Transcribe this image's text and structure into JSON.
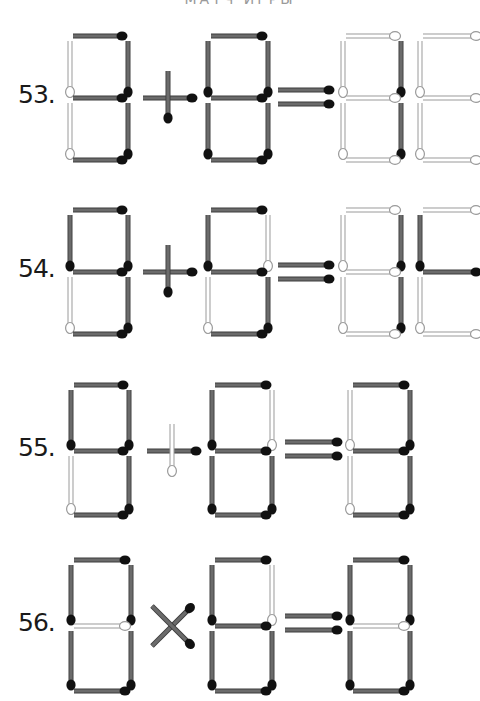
{
  "header": {
    "text": "МАТЧ ИГРЫ"
  },
  "colors": {
    "dark_stick": "#6b6b6b",
    "dark_stick_edge": "#3c3c3c",
    "dark_head": "#111111",
    "light_stick_fill": "#ffffff",
    "light_stick_edge": "#9a9a9a",
    "background": "#ffffff"
  },
  "puzzles": [
    {
      "number": "53.",
      "equation": "8 + 8 = 88",
      "layout": {
        "top": 36,
        "mid": 98,
        "bot": 160
      },
      "digits": [
        {
          "x": 70,
          "w": 58,
          "segments": {
            "a": "dark",
            "b": "dark",
            "c": "dark",
            "d": "dark",
            "e": "light",
            "f": "light",
            "g": "dark"
          }
        },
        {
          "x": 208,
          "w": 60,
          "segments": {
            "a": "dark",
            "b": "dark",
            "c": "dark",
            "d": "dark",
            "e": "dark",
            "f": "dark",
            "g": "dark"
          }
        },
        {
          "x": 343,
          "w": 58,
          "segments": {
            "a": "light",
            "b": "dark",
            "c": "dark",
            "d": "light",
            "e": "light",
            "f": "light",
            "g": "light"
          }
        },
        {
          "x": 420,
          "w": 62,
          "segments": {
            "a": "light",
            "b": "none",
            "c": "none",
            "d": "light",
            "e": "light",
            "f": "light",
            "g": "light"
          }
        }
      ],
      "operator": {
        "type": "plus",
        "cx": 168,
        "h_state": "dark",
        "v_state": "dark"
      },
      "equals": {
        "x1": 278,
        "x2": 332,
        "y1": 90,
        "y2": 104,
        "state": "dark"
      }
    },
    {
      "number": "54.",
      "equation": "8 + 8 = 88",
      "layout": {
        "top": 210,
        "mid": 272,
        "bot": 334
      },
      "digits": [
        {
          "x": 70,
          "w": 58,
          "segments": {
            "a": "dark",
            "b": "dark",
            "c": "dark",
            "d": "dark",
            "e": "light",
            "f": "dark",
            "g": "dark"
          }
        },
        {
          "x": 208,
          "w": 60,
          "segments": {
            "a": "dark",
            "b": "light",
            "c": "dark",
            "d": "dark",
            "e": "light",
            "f": "dark",
            "g": "dark"
          }
        },
        {
          "x": 343,
          "w": 58,
          "segments": {
            "a": "light",
            "b": "dark",
            "c": "dark",
            "d": "light",
            "e": "light",
            "f": "light",
            "g": "light"
          }
        },
        {
          "x": 420,
          "w": 62,
          "segments": {
            "a": "light",
            "b": "none",
            "c": "none",
            "d": "light",
            "e": "light",
            "f": "dark",
            "g": "dark"
          }
        }
      ],
      "operator": {
        "type": "plus",
        "cx": 168,
        "h_state": "dark",
        "v_state": "dark"
      },
      "equals": {
        "x1": 278,
        "x2": 332,
        "y1": 265,
        "y2": 279,
        "state": "dark"
      }
    },
    {
      "number": "55.",
      "equation": "8 + 8 = 8",
      "layout": {
        "top": 385,
        "mid": 451,
        "bot": 515
      },
      "digits": [
        {
          "x": 71,
          "w": 58,
          "segments": {
            "a": "dark",
            "b": "dark",
            "c": "dark",
            "d": "dark",
            "e": "light",
            "f": "dark",
            "g": "dark"
          }
        },
        {
          "x": 212,
          "w": 60,
          "segments": {
            "a": "dark",
            "b": "light",
            "c": "dark",
            "d": "dark",
            "e": "dark",
            "f": "dark",
            "g": "dark"
          }
        },
        {
          "x": 350,
          "w": 60,
          "segments": {
            "a": "dark",
            "b": "dark",
            "c": "dark",
            "d": "dark",
            "e": "light",
            "f": "light",
            "g": "dark"
          }
        }
      ],
      "operator": {
        "type": "plus",
        "cx": 172,
        "h_state": "dark",
        "v_state": "light"
      },
      "equals": {
        "x1": 285,
        "x2": 340,
        "y1": 442,
        "y2": 456,
        "state": "dark"
      }
    },
    {
      "number": "56.",
      "equation": "8 × 8 = 8",
      "layout": {
        "top": 560,
        "mid": 626,
        "bot": 691
      },
      "digits": [
        {
          "x": 71,
          "w": 60,
          "segments": {
            "a": "dark",
            "b": "dark",
            "c": "dark",
            "d": "dark",
            "e": "dark",
            "f": "dark",
            "g": "light"
          }
        },
        {
          "x": 212,
          "w": 60,
          "segments": {
            "a": "dark",
            "b": "light",
            "c": "dark",
            "d": "dark",
            "e": "dark",
            "f": "dark",
            "g": "dark"
          }
        },
        {
          "x": 350,
          "w": 60,
          "segments": {
            "a": "dark",
            "b": "dark",
            "c": "dark",
            "d": "dark",
            "e": "dark",
            "f": "dark",
            "g": "light"
          }
        }
      ],
      "operator": {
        "type": "times",
        "cx": 172,
        "h_state": "dark",
        "v_state": "dark"
      },
      "equals": {
        "x1": 285,
        "x2": 340,
        "y1": 616,
        "y2": 630,
        "state": "dark"
      }
    }
  ]
}
